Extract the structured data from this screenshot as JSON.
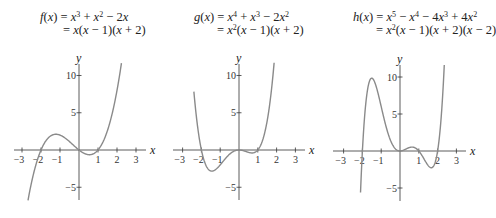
{
  "chart_data": [
    {
      "type": "line",
      "title": "f(x) = x^3 + x^2 - 2x = x(x - 1)(x + 2)",
      "title_line1": "f(x) = x³ + x² − 2x",
      "title_line2": "= x(x − 1)(x + 2)",
      "xlabel": "x",
      "ylabel": "y",
      "xticks": [
        -3,
        -2,
        -1,
        1,
        2,
        3
      ],
      "yticks": [
        -5,
        5,
        10
      ],
      "xlim": [
        -3.4,
        3.5
      ],
      "ylim": [
        -7,
        12
      ],
      "coefficients": [
        0,
        -2,
        1,
        1
      ],
      "x_range": [
        -2.7,
        2.3
      ],
      "roots": [
        -2,
        0,
        1
      ],
      "grid": false,
      "curve_color": "#8a8a8a",
      "origin_px": [
        79,
        150
      ],
      "unit_px": [
        19,
        7.45
      ],
      "axis_px": {
        "x_from": 14,
        "x_to": 146,
        "y_from": 64,
        "y_to": 200
      },
      "formula_px": [
        40,
        11
      ]
    },
    {
      "type": "line",
      "title": "g(x) = x^4 + x^3 - 2x^2 = x^2(x - 1)(x + 2)",
      "title_line1": "g(x) = x⁴ + x³ − 2x²",
      "title_line2": "= x²(x − 1)(x + 2)",
      "xlabel": "x",
      "ylabel": "y",
      "xticks": [
        -3,
        -2,
        -1,
        1,
        2,
        3
      ],
      "yticks": [
        -5,
        5,
        10
      ],
      "xlim": [
        -3.4,
        3.5
      ],
      "ylim": [
        -7,
        12
      ],
      "coefficients": [
        0,
        0,
        -2,
        1,
        1
      ],
      "x_range": [
        -2.4,
        2.0
      ],
      "roots": [
        -2,
        0,
        1
      ],
      "grid": false,
      "curve_color": "#8a8a8a",
      "origin_px": [
        239,
        150
      ],
      "unit_px": [
        18.8,
        7.45
      ],
      "axis_px": {
        "x_from": 173,
        "x_to": 305,
        "y_from": 64,
        "y_to": 200
      },
      "formula_px": [
        194,
        11
      ]
    },
    {
      "type": "line",
      "title": "h(x) = x^5 - x^4 - 4x^3 + 4x^2 = x^2(x - 1)(x + 2)(x - 2)",
      "title_line1": "h(x) = x⁵ − x⁴ − 4x³ + 4x²",
      "title_line2": "= x²(x − 1)(x + 2)(x − 2)",
      "xlabel": "x",
      "ylabel": "y",
      "xticks": [
        -3,
        -2,
        -1,
        1,
        2,
        3
      ],
      "yticks": [
        -5,
        5,
        10
      ],
      "xlim": [
        -3.4,
        3.5
      ],
      "ylim": [
        -7,
        12
      ],
      "coefficients": [
        0,
        0,
        4,
        -4,
        -1,
        1
      ],
      "x_range": [
        -2.1,
        2.4
      ],
      "roots": [
        -2,
        0,
        1,
        2
      ],
      "grid": false,
      "curve_color": "#8a8a8a",
      "origin_px": [
        400,
        151
      ],
      "unit_px": [
        18.8,
        7.4
      ],
      "axis_px": {
        "x_from": 333,
        "x_to": 466,
        "y_from": 65,
        "y_to": 201
      },
      "formula_px": [
        353,
        11
      ]
    }
  ]
}
